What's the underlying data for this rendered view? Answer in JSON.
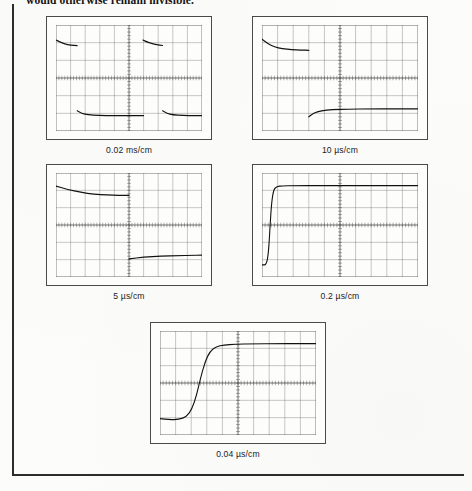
{
  "page": {
    "running_text": "would otherwise remain invisible.",
    "rule_color": "#2c2c2c",
    "paper_color": "#fcfcfb",
    "trace_color": "#111111",
    "graticule_color": "#555555"
  },
  "figure": {
    "scopes": [
      {
        "id": "scope-0-02-ms",
        "caption": "0.02 ms/cm",
        "divisions_x": 10,
        "divisions_y": 6,
        "description": "Two full pulse cycles compressed; flat top and flat bottom levels with fast unresolved edges",
        "chart_data": {
          "type": "line",
          "title": "0.02 ms/cm",
          "xlabel": "time (0.02 ms per division)",
          "ylabel": "amplitude (divisions)",
          "xlim": [
            0,
            10
          ],
          "ylim": [
            -3,
            3
          ],
          "grid": true,
          "legend": "none",
          "series": [
            {
              "name": "upper-level-segment-1",
              "x": [
                0.0,
                0.25,
                0.6,
                1.0,
                1.45
              ],
              "y": [
                2.15,
                2.05,
                1.93,
                1.86,
                1.83
              ]
            },
            {
              "name": "lower-level-segment-1",
              "x": [
                1.45,
                1.75,
                2.2,
                2.9,
                4.0,
                5.2,
                6.0
              ],
              "y": [
                -1.85,
                -2.0,
                -2.08,
                -2.12,
                -2.13,
                -2.13,
                -2.13
              ]
            },
            {
              "name": "upper-level-segment-2",
              "x": [
                5.95,
                6.2,
                6.55,
                6.9,
                7.3
              ],
              "y": [
                2.15,
                2.05,
                1.95,
                1.88,
                1.84
              ]
            },
            {
              "name": "lower-level-segment-2",
              "x": [
                7.3,
                7.6,
                8.0,
                8.7,
                9.5,
                10.0
              ],
              "y": [
                -1.85,
                -2.0,
                -2.08,
                -2.12,
                -2.13,
                -2.13
              ]
            }
          ]
        }
      },
      {
        "id": "scope-10-us",
        "caption": "10 µs/cm",
        "divisions_x": 10,
        "divisions_y": 6,
        "description": "One pulse cycle; droop visible on the top level, edge still unresolved",
        "chart_data": {
          "type": "line",
          "title": "10 µs/cm",
          "xlabel": "time (10 µs per division)",
          "ylabel": "amplitude (divisions)",
          "xlim": [
            0,
            10
          ],
          "ylim": [
            -3,
            3
          ],
          "grid": true,
          "legend": "none",
          "series": [
            {
              "name": "upper-level",
              "x": [
                0.0,
                0.35,
                0.8,
                1.3,
                1.9,
                2.5,
                3.0
              ],
              "y": [
                2.2,
                1.95,
                1.76,
                1.66,
                1.6,
                1.58,
                1.57
              ]
            },
            {
              "name": "lower-level",
              "x": [
                3.0,
                3.3,
                3.8,
                4.5,
                5.5,
                7.0,
                8.5,
                10.0
              ],
              "y": [
                -2.2,
                -1.98,
                -1.85,
                -1.79,
                -1.76,
                -1.75,
                -1.75,
                -1.75
              ]
            }
          ]
        }
      },
      {
        "id": "scope-5-us",
        "caption": "5 µs/cm",
        "divisions_x": 10,
        "divisions_y": 6,
        "description": "Half cycle expanded; gentle exponential droop on upper trace, lower trace begins at centre",
        "chart_data": {
          "type": "line",
          "title": "5 µs/cm",
          "xlabel": "time (5 µs per division)",
          "ylabel": "amplitude (divisions)",
          "xlim": [
            0,
            10
          ],
          "ylim": [
            -3,
            3
          ],
          "grid": true,
          "legend": "none",
          "series": [
            {
              "name": "upper-level",
              "x": [
                0.0,
                0.8,
                1.7,
                2.6,
                3.5,
                4.3,
                5.0
              ],
              "y": [
                2.25,
                2.05,
                1.88,
                1.78,
                1.73,
                1.71,
                1.71
              ]
            },
            {
              "name": "lower-level",
              "x": [
                5.0,
                6.0,
                7.2,
                8.4,
                9.3,
                10.0
              ],
              "y": [
                -1.95,
                -1.86,
                -1.8,
                -1.77,
                -1.75,
                -1.74
              ]
            }
          ]
        }
      },
      {
        "id": "scope-0-2-us",
        "caption": "0.2 µs/cm",
        "divisions_x": 10,
        "divisions_y": 6,
        "description": "Rising edge now resolved as a steep transition near the left of the screen with a flat top after it",
        "chart_data": {
          "type": "line",
          "title": "0.2 µs/cm",
          "xlabel": "time (0.2 µs per division)",
          "ylabel": "amplitude (divisions)",
          "xlim": [
            0,
            10
          ],
          "ylim": [
            -3,
            3
          ],
          "grid": true,
          "legend": "none",
          "series": [
            {
              "name": "step-response",
              "x": [
                0.0,
                0.28,
                0.42,
                0.52,
                0.62,
                0.75,
                0.95,
                1.3,
                2.0,
                4.0,
                6.0,
                8.0,
                10.0
              ],
              "y": [
                -2.3,
                -2.3,
                -1.6,
                0.0,
                1.35,
                2.05,
                2.22,
                2.26,
                2.27,
                2.27,
                2.27,
                2.27,
                2.27
              ]
            }
          ]
        }
      },
      {
        "id": "scope-0-04-us",
        "caption": "0.04 µs/cm",
        "divisions_x": 10,
        "divisions_y": 6,
        "description": "Fastest sweep; full S-shaped rise time of the edge is displayed across about two divisions",
        "chart_data": {
          "type": "line",
          "title": "0.04 µs/cm",
          "xlabel": "time (0.04 µs per division)",
          "ylabel": "amplitude (divisions)",
          "xlim": [
            0,
            10
          ],
          "ylim": [
            -3,
            3
          ],
          "grid": true,
          "legend": "none",
          "series": [
            {
              "name": "step-response",
              "x": [
                0.0,
                0.6,
                1.2,
                1.7,
                2.05,
                2.35,
                2.6,
                2.9,
                3.2,
                3.6,
                4.1,
                4.8,
                6.0,
                7.5,
                9.0,
                10.0
              ],
              "y": [
                -2.05,
                -2.12,
                -2.1,
                -1.95,
                -1.5,
                -0.7,
                0.3,
                1.25,
                1.82,
                2.1,
                2.2,
                2.24,
                2.26,
                2.27,
                2.27,
                2.27
              ]
            }
          ]
        }
      }
    ]
  }
}
